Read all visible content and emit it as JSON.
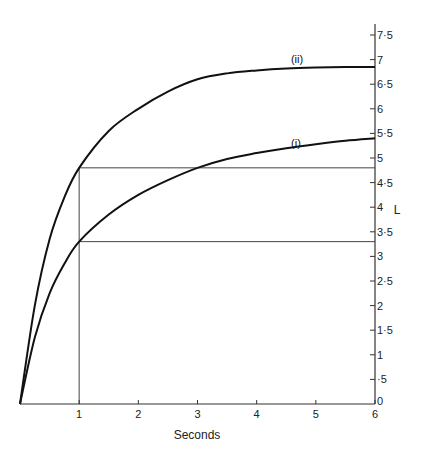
{
  "chart_data": {
    "type": "line",
    "title": "",
    "xlabel": "Seconds",
    "ylabel": "L",
    "xlim": [
      0,
      6
    ],
    "ylim": [
      0,
      7.5
    ],
    "grid": false,
    "legend": "none (curves labelled inline)",
    "x_ticks": [
      "1",
      "2",
      "3",
      "4",
      "5",
      "6"
    ],
    "y_ticks": [
      "0",
      "·5",
      "1",
      "1·5",
      "2",
      "2·5",
      "3",
      "3·5",
      "4",
      "4·5",
      "5",
      "5·5",
      "6",
      "6·5",
      "7",
      "7·5"
    ],
    "y_tick_values": [
      0,
      0.5,
      1,
      1.5,
      2,
      2.5,
      3,
      3.5,
      4,
      4.5,
      5,
      5.5,
      6,
      6.5,
      7,
      7.5
    ],
    "series": [
      {
        "name": "(i)",
        "x": [
          0,
          0.25,
          0.5,
          0.75,
          1,
          1.5,
          2,
          2.5,
          3,
          3.5,
          4,
          4.5,
          5,
          5.5,
          6
        ],
        "values": [
          0,
          1.35,
          2.25,
          2.85,
          3.3,
          3.85,
          4.25,
          4.55,
          4.8,
          4.98,
          5.1,
          5.2,
          5.28,
          5.35,
          5.4
        ]
      },
      {
        "name": "(ii)",
        "x": [
          0,
          0.25,
          0.5,
          0.75,
          1,
          1.5,
          2,
          2.5,
          3,
          3.5,
          4,
          4.5,
          5,
          5.5,
          6
        ],
        "values": [
          0,
          2.0,
          3.35,
          4.2,
          4.8,
          5.55,
          6.0,
          6.35,
          6.6,
          6.72,
          6.78,
          6.82,
          6.84,
          6.85,
          6.85
        ]
      }
    ],
    "annotations": [
      {
        "type": "vline",
        "x": 1,
        "from": 0,
        "to": 4.8
      },
      {
        "type": "hline",
        "y": 4.8,
        "from_x": 1,
        "to_x": 6,
        "note": "level reached by (ii) at t=1, reached by (i) at t≈3"
      },
      {
        "type": "hline",
        "y": 3.3,
        "from_x": 1,
        "to_x": 6,
        "note": "level reached by (i) at t=1"
      }
    ]
  },
  "labels": {
    "x_axis_title": "Seconds",
    "y_axis_title": "L",
    "curve_i": "(i)",
    "curve_ii": "(ii)"
  },
  "colors": {
    "line": "#111111",
    "axis": "#333333",
    "guide": "#444444"
  }
}
